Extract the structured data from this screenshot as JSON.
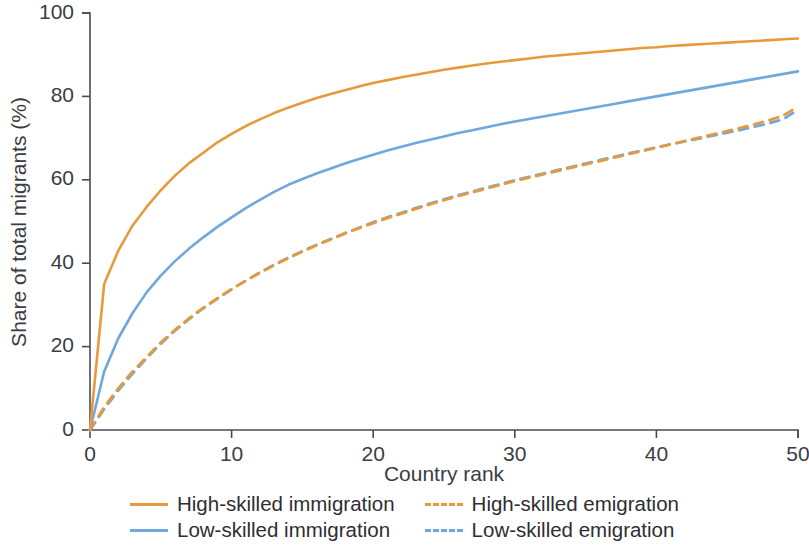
{
  "chart_data": {
    "type": "line",
    "title": "",
    "subtitle": "",
    "xlabel": "Country rank",
    "ylabel": "Share of total migrants (%)",
    "xlim": [
      0,
      50
    ],
    "ylim": [
      0,
      100
    ],
    "xticks": [
      0,
      10,
      20,
      30,
      40,
      50
    ],
    "yticks": [
      0,
      20,
      40,
      60,
      80,
      100
    ],
    "grid": false,
    "legend_position": "bottom",
    "legend_columns": 2,
    "x": [
      0,
      1,
      2,
      3,
      4,
      5,
      6,
      7,
      8,
      9,
      10,
      11,
      12,
      13,
      14,
      15,
      16,
      17,
      18,
      19,
      20,
      21,
      22,
      23,
      24,
      25,
      26,
      27,
      28,
      29,
      30,
      31,
      32,
      33,
      34,
      35,
      36,
      37,
      38,
      39,
      40,
      41,
      42,
      43,
      44,
      45,
      46,
      47,
      48,
      49,
      50
    ],
    "series": [
      {
        "name": "High-skilled immigration",
        "color": "#E79A3C",
        "style": "solid",
        "values": [
          0,
          35.0,
          43.0,
          49.0,
          53.5,
          57.5,
          61.0,
          64.0,
          66.5,
          69.0,
          71.0,
          72.9,
          74.5,
          76.0,
          77.3,
          78.5,
          79.6,
          80.6,
          81.5,
          82.4,
          83.2,
          83.9,
          84.6,
          85.2,
          85.8,
          86.4,
          86.9,
          87.4,
          87.9,
          88.3,
          88.7,
          89.1,
          89.5,
          89.8,
          90.1,
          90.4,
          90.7,
          91.0,
          91.3,
          91.6,
          91.8,
          92.1,
          92.3,
          92.5,
          92.7,
          92.9,
          93.1,
          93.3,
          93.5,
          93.7,
          93.9
        ]
      },
      {
        "name": "Low-skilled immigration",
        "color": "#6FA8DC",
        "style": "solid",
        "values": [
          0,
          14.0,
          22.0,
          28.0,
          33.0,
          37.0,
          40.5,
          43.5,
          46.2,
          48.7,
          51.0,
          53.2,
          55.2,
          57.1,
          58.8,
          60.2,
          61.5,
          62.7,
          63.9,
          65.0,
          66.0,
          67.0,
          67.9,
          68.8,
          69.6,
          70.4,
          71.2,
          71.9,
          72.6,
          73.3,
          74.0,
          74.6,
          75.2,
          75.8,
          76.4,
          77.0,
          77.6,
          78.2,
          78.8,
          79.4,
          80.0,
          80.6,
          81.2,
          81.8,
          82.4,
          83.0,
          83.6,
          84.2,
          84.8,
          85.4,
          86.0
        ]
      },
      {
        "name": "High-skilled emigration",
        "color": "#E79A3C",
        "style": "dashed",
        "values": [
          0,
          5.5,
          10.0,
          14.0,
          17.5,
          21.0,
          24.0,
          26.8,
          29.3,
          31.6,
          33.8,
          35.8,
          37.7,
          39.5,
          41.2,
          42.8,
          44.3,
          45.7,
          47.1,
          48.4,
          49.6,
          50.8,
          51.9,
          53.0,
          54.1,
          55.1,
          56.1,
          57.0,
          57.9,
          58.8,
          59.7,
          60.5,
          61.3,
          62.1,
          62.9,
          63.7,
          64.5,
          65.3,
          66.1,
          66.9,
          67.7,
          68.5,
          69.3,
          70.1,
          70.9,
          71.7,
          72.5,
          73.4,
          74.3,
          75.5,
          77.5
        ]
      },
      {
        "name": "Low-skilled emigration",
        "color": "#6FA8DC",
        "style": "dashed",
        "values": [
          0,
          5.0,
          9.5,
          13.5,
          17.2,
          20.7,
          23.8,
          26.6,
          29.2,
          31.5,
          33.7,
          35.8,
          37.8,
          39.6,
          41.3,
          42.9,
          44.4,
          45.8,
          47.2,
          48.5,
          49.8,
          51.0,
          52.1,
          53.2,
          54.3,
          55.3,
          56.3,
          57.2,
          58.1,
          59.0,
          59.9,
          60.7,
          61.5,
          62.3,
          63.1,
          63.9,
          64.7,
          65.5,
          66.3,
          67.0,
          67.8,
          68.5,
          69.2,
          69.9,
          70.6,
          71.3,
          72.0,
          72.8,
          73.6,
          74.6,
          76.8
        ]
      }
    ]
  },
  "axes": {
    "xlabel": "Country rank",
    "ylabel": "Share of total migrants (%)",
    "xticks": [
      "0",
      "10",
      "20",
      "30",
      "40",
      "50"
    ],
    "yticks": [
      "0",
      "20",
      "40",
      "60",
      "80",
      "100"
    ]
  },
  "legend": {
    "entries": [
      {
        "label": "High-skilled immigration",
        "color": "#E79A3C",
        "style": "solid"
      },
      {
        "label": "High-skilled emigration",
        "color": "#E79A3C",
        "style": "dashed"
      },
      {
        "label": "Low-skilled immigration",
        "color": "#6FA8DC",
        "style": "solid"
      },
      {
        "label": "Low-skilled emigration",
        "color": "#6FA8DC",
        "style": "dashed"
      }
    ]
  }
}
